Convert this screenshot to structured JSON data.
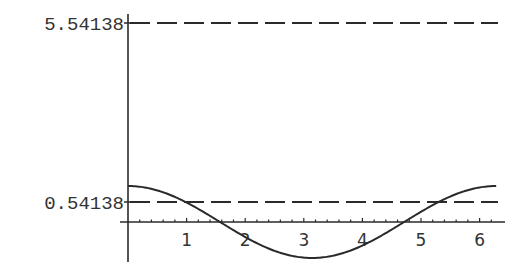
{
  "chart_data": {
    "type": "line",
    "title": "",
    "xlabel": "",
    "ylabel": "",
    "xlim": [
      0,
      6.2832
    ],
    "x_ticks": [
      1,
      2,
      3,
      4,
      5,
      6
    ],
    "y_tick_labels": [
      "5.54138",
      "0.54138"
    ],
    "grid": false,
    "legend": null,
    "series": [
      {
        "name": "cos(x)",
        "style": "solid",
        "function": "cos(x)",
        "x": [
          0,
          0.5,
          1,
          1.5,
          2,
          2.5,
          3,
          3.1416,
          3.5,
          4,
          4.5,
          5,
          5.5,
          6,
          6.2832
        ],
        "values": [
          1,
          0.878,
          0.54,
          0.071,
          -0.416,
          -0.801,
          -0.99,
          -1,
          -0.936,
          -0.654,
          -0.211,
          0.284,
          0.709,
          0.96,
          1
        ]
      },
      {
        "name": "y = 5.54138",
        "style": "dashed",
        "constant": 5.54138
      },
      {
        "name": "y = 0.54138",
        "style": "dashed",
        "constant": 0.54138
      }
    ]
  },
  "axis": {
    "y_labels": [
      {
        "text": "5.54138",
        "value": 5.54138
      },
      {
        "text": "0.54138",
        "value": 0.54138
      }
    ],
    "x_labels": [
      "1",
      "2",
      "3",
      "4",
      "5",
      "6"
    ]
  },
  "colors": {
    "line": "#2a2a2a",
    "text": "#333333",
    "background": "#ffffff"
  }
}
